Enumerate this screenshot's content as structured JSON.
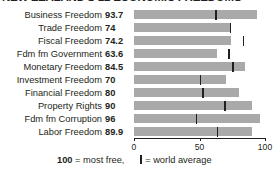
{
  "chart_data": {
    "type": "bar",
    "title": "NEW ZEALAND'S 12 ECONOMIC FREEDOMS",
    "xlabel": "",
    "ylabel": "",
    "xlim": [
      0,
      100
    ],
    "grid": false,
    "orientation": "horizontal",
    "axis_ticks": [
      {
        "value": 0,
        "label": "0"
      },
      {
        "value": 50,
        "label": "50"
      },
      {
        "value": 100,
        "label": "100"
      }
    ],
    "categories": [
      "Business Freedom",
      "Trade Freedom",
      "Fiscal Freedom",
      "Fdm fm Government",
      "Monetary Freedom",
      "Investment Freedom",
      "Financial Freedom",
      "Property Rights",
      "Fdm fm Corruption",
      "Labor Freedom"
    ],
    "values": [
      93.7,
      74,
      74.2,
      63.6,
      84.5,
      70,
      80,
      90,
      96,
      89.9
    ],
    "value_labels": [
      "93.7",
      "74",
      "74.2",
      "63.6",
      "84.5",
      "70",
      "80",
      "90",
      "96",
      "89.9"
    ],
    "world_average": [
      62,
      73,
      83,
      72,
      75,
      50,
      52,
      69,
      47,
      63
    ],
    "series": [
      {
        "name": "New Zealand score",
        "values": [
          93.7,
          74,
          74.2,
          63.6,
          84.5,
          70,
          80,
          90,
          96,
          89.9
        ]
      },
      {
        "name": "world average",
        "values": [
          62,
          73,
          83,
          72,
          75,
          50,
          52,
          69,
          47,
          63
        ]
      }
    ],
    "colors": {
      "bar": "#a9a9a9",
      "tick": "#231f20",
      "text": "#231f20"
    }
  },
  "footnote": {
    "most_free": "100",
    "most_free_text": " = most free,",
    "world_average_text": "= world average"
  }
}
